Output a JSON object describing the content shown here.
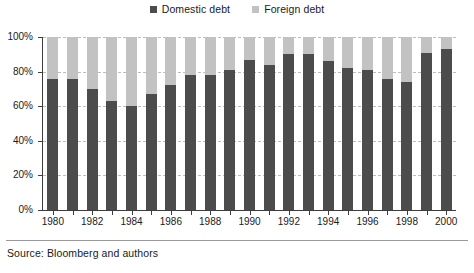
{
  "legend": {
    "position": "top-center",
    "items": [
      {
        "label": "Domestic debt",
        "color": "#4c4c4c",
        "swatch_name": "legend-swatch-domestic"
      },
      {
        "label": "Foreign debt",
        "color": "#c2c2c2",
        "swatch_name": "legend-swatch-foreign"
      }
    ]
  },
  "axes": {
    "y_ticks": [
      "0%",
      "20%",
      "40%",
      "60%",
      "80%",
      "100%"
    ],
    "x_ticks_labeled": [
      "1980",
      "1982",
      "1984",
      "1986",
      "1988",
      "1990",
      "1992",
      "1994",
      "1996",
      "1998",
      "2000"
    ]
  },
  "source": {
    "text": "Source: Bloomberg and authors"
  },
  "chart_data": {
    "type": "bar",
    "stacked": true,
    "stack_total": 100,
    "title": "",
    "subtitle": "",
    "xlabel": "",
    "ylabel": "",
    "ylim": [
      0,
      100
    ],
    "ytick_values": [
      0,
      20,
      40,
      60,
      80,
      100
    ],
    "ytick_labels": [
      "0%",
      "20%",
      "40%",
      "60%",
      "80%",
      "100%"
    ],
    "grid": true,
    "grid_axis": "y",
    "legend_position": "top-center",
    "categories": [
      "1980",
      "1981",
      "1982",
      "1983",
      "1984",
      "1985",
      "1986",
      "1987",
      "1988",
      "1989",
      "1990",
      "1991",
      "1992",
      "1993",
      "1994",
      "1995",
      "1996",
      "1997",
      "1998",
      "1999",
      "2000"
    ],
    "xtick_labels_shown": [
      "1980",
      "",
      "1982",
      "",
      "1984",
      "",
      "1986",
      "",
      "1988",
      "",
      "1990",
      "",
      "1992",
      "",
      "1994",
      "",
      "1996",
      "",
      "1998",
      "",
      "2000"
    ],
    "series": [
      {
        "name": "Domestic debt",
        "color": "#4c4c4c",
        "values": [
          76,
          76,
          70,
          63,
          60,
          67,
          72,
          78,
          78,
          81,
          87,
          84,
          90,
          90,
          86,
          82,
          81,
          76,
          74,
          91,
          93
        ]
      },
      {
        "name": "Foreign debt",
        "color": "#c2c2c2",
        "values": [
          24,
          24,
          30,
          37,
          40,
          33,
          28,
          22,
          22,
          19,
          13,
          16,
          10,
          10,
          14,
          18,
          19,
          24,
          26,
          9,
          7
        ]
      }
    ]
  }
}
